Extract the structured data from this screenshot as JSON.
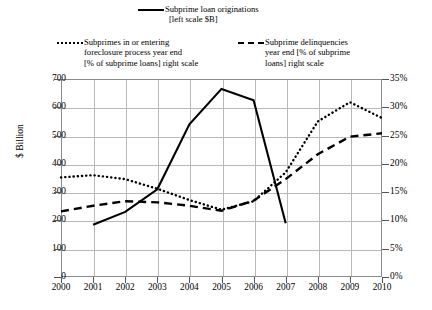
{
  "legend": {
    "originations": {
      "icon": "solid-line-swatch",
      "line1": "Subprime loan originations",
      "line2": "[left scale $B]"
    },
    "foreclosure": {
      "icon": "dotted-line-swatch",
      "line1": "Subprimes in or entering",
      "line2": "foreclosure process year end",
      "line3": "[% of subprime loans] right scale"
    },
    "delinquency": {
      "icon": "dashed-line-swatch",
      "line1": "Subprime delinquencies",
      "line2": "year end [% of subprime",
      "line3": "loans] right scale"
    }
  },
  "axes": {
    "left_label": "$ Billion",
    "left_ticks": [
      "700",
      "600",
      "500",
      "400",
      "300",
      "200",
      "100",
      "0"
    ],
    "right_ticks": [
      "35%",
      "30%",
      "25%",
      "20%",
      "15%",
      "10%",
      "5%",
      "0%"
    ],
    "x_ticks": [
      "2000",
      "2001",
      "2002",
      "2003",
      "2004",
      "2005",
      "2006",
      "2007",
      "2008",
      "2009",
      "2010"
    ]
  },
  "chart_data": {
    "type": "line",
    "title": "",
    "xlabel": "",
    "ylabel": "$ Billion",
    "y2label": "% of subprime loans",
    "grid": true,
    "legend_position": "top",
    "x": [
      2000,
      2001,
      2002,
      2003,
      2004,
      2005,
      2006,
      2007,
      2008,
      2009,
      2010
    ],
    "ylim": [
      0,
      700
    ],
    "y2lim": [
      0,
      35
    ],
    "series": [
      {
        "name": "Subprime loan originations",
        "style": "solid",
        "axis": "left",
        "units": "$B",
        "x": [
          2001,
          2002,
          2003,
          2004,
          2005,
          2006,
          2007
        ],
        "values": [
          185,
          230,
          310,
          540,
          665,
          625,
          190
        ]
      },
      {
        "name": "Subprimes in or entering foreclosure process year end",
        "style": "dotted",
        "axis": "right",
        "units": "%",
        "x": [
          2000,
          2001,
          2002,
          2003,
          2004,
          2005,
          2006,
          2007,
          2008,
          2009,
          2010
        ],
        "values": [
          17.6,
          18.0,
          17.3,
          15.6,
          13.6,
          11.9,
          13.4,
          18.5,
          27.5,
          30.9,
          28.1
        ]
      },
      {
        "name": "Subprime delinquencies year end [% of subprime loans]",
        "style": "dashed",
        "axis": "right",
        "units": "%",
        "x": [
          2000,
          2001,
          2002,
          2003,
          2004,
          2005,
          2006,
          2007,
          2008,
          2009,
          2010
        ],
        "values": [
          11.6,
          12.6,
          13.4,
          13.2,
          12.6,
          11.7,
          13.5,
          17.3,
          21.7,
          24.8,
          25.4
        ]
      }
    ]
  }
}
